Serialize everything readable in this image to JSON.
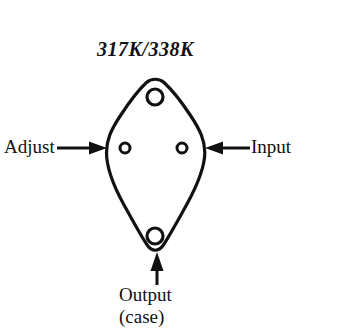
{
  "figure": {
    "type": "transistor-package-pinout",
    "package": "TO-3 (diamond / lozenge case)",
    "part_number": "317K/338K",
    "background_color": "#ffffff",
    "line_color": "#111111",
    "labels": {
      "adjust": "Adjust",
      "input": "Input",
      "output": "Output",
      "output_sub": "(case)"
    },
    "pins": [
      {
        "name": "adjust-pin-hole",
        "x": 125,
        "y": 148,
        "r": 5
      },
      {
        "name": "input-pin-hole",
        "x": 182,
        "y": 148,
        "r": 5
      }
    ],
    "mounting_holes": [
      {
        "name": "top-mounting-hole",
        "x": 155,
        "y": 97,
        "r": 8
      },
      {
        "name": "bottom-mounting-hole",
        "x": 155,
        "y": 236,
        "r": 8
      }
    ],
    "arrows": [
      {
        "name": "adjust-arrow",
        "direction": "right",
        "from_x": 57,
        "to_x": 107,
        "y": 148
      },
      {
        "name": "input-arrow",
        "direction": "left",
        "from_x": 250,
        "to_x": 206,
        "y": 148
      },
      {
        "name": "output-arrow",
        "direction": "up",
        "x": 157,
        "from_y": 285,
        "to_y": 253
      }
    ],
    "outline": {
      "left_vertex": [
        106,
        148
      ],
      "right_vertex": [
        205,
        148
      ],
      "top_vertex": [
        155,
        79
      ],
      "bottom_vertex": [
        155,
        252
      ]
    }
  }
}
